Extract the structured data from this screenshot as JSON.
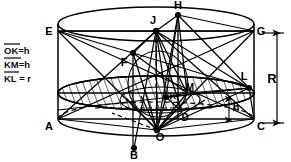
{
  "figure": {
    "stroke_color": "#000000",
    "background_color": "#ffffff",
    "legend": {
      "lines": [
        {
          "segment": "OK",
          "relation": "=",
          "value": "h",
          "overline": true
        },
        {
          "segment": "KM",
          "relation": "=",
          "value": "h",
          "overline": true
        },
        {
          "segment": "KL",
          "relation": "=",
          "value": "r",
          "overline": true
        }
      ],
      "line1_text": "OK=h",
      "line2_text": "KM=h",
      "line3_text": "KL = r"
    },
    "points": [
      {
        "id": "E",
        "label": "E",
        "x": 49,
        "y": 31,
        "dot": false
      },
      {
        "id": "G",
        "label": "G",
        "x": 258,
        "y": 31,
        "dot": false
      },
      {
        "id": "A",
        "label": "A",
        "x": 49,
        "y": 126,
        "dot": false
      },
      {
        "id": "C",
        "label": "C",
        "x": 258,
        "y": 126,
        "dot": false
      },
      {
        "id": "H",
        "label": "H",
        "x": 178,
        "y": 7,
        "dot": true
      },
      {
        "id": "J",
        "label": "J",
        "x": 152,
        "y": 22,
        "dot": true
      },
      {
        "id": "F",
        "label": "F",
        "x": 125,
        "y": 63,
        "dot": true
      },
      {
        "id": "L",
        "label": "L",
        "x": 243,
        "y": 77,
        "dot": true
      },
      {
        "id": "M",
        "label": "M",
        "x": 189,
        "y": 88,
        "dot": true
      },
      {
        "id": "K",
        "label": "K",
        "x": 172,
        "y": 95,
        "dot": true
      },
      {
        "id": "D",
        "label": "D",
        "x": 185,
        "y": 120,
        "dot": false
      },
      {
        "id": "O",
        "label": "O",
        "x": 160,
        "y": 135,
        "dot": true
      },
      {
        "id": "B",
        "label": "B",
        "x": 134,
        "y": 155,
        "dot": true
      }
    ],
    "dimensions": [
      {
        "id": "R",
        "label": "R",
        "x": 272,
        "y": 79,
        "from_y": 33,
        "to_y": 123,
        "orientation": "vertical"
      },
      {
        "id": "h",
        "label": "h",
        "x": 239,
        "y": 108,
        "from_y": 98,
        "to_y": 120,
        "orientation": "vertical"
      }
    ],
    "hatched_region": "mid-ellipse-disc"
  }
}
